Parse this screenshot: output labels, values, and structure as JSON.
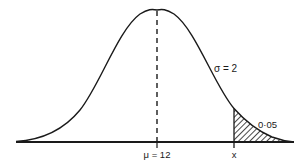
{
  "diagram": {
    "type": "normal-distribution",
    "sigma_label": "σ = 2",
    "mean_label": "μ = 12",
    "x_label": "x",
    "tail_area_label": "0·05",
    "mean": 12,
    "sigma": 2,
    "tail_area": 0.05,
    "colors": {
      "ink": "#1a1a1a",
      "background": "#ffffff"
    }
  }
}
